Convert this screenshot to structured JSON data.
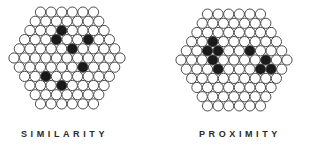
{
  "figure": {
    "panels": [
      {
        "id": "similarity",
        "label": "SIMILARITY",
        "label_pos": {
          "x": 21,
          "y": 129
        },
        "cluster": {
          "center": {
            "x": 67,
            "y": 58
          },
          "radius": 56,
          "spacing": 10.6,
          "circle_radius": 5.1,
          "dark_circles": [
            [
              56,
              35
            ],
            [
              65,
              30
            ],
            [
              88,
              40
            ],
            [
              69,
              52
            ],
            [
              80,
              67
            ],
            [
              43,
              72
            ],
            [
              63,
              82
            ]
          ]
        }
      },
      {
        "id": "proximity",
        "label": "PROXIMITY",
        "label_pos": {
          "x": 199,
          "y": 129
        },
        "cluster": {
          "center": {
            "x": 234,
            "y": 60
          },
          "radius": 57,
          "spacing": 10.6,
          "circle_radius": 5.1,
          "dark_circles": [
            [
              213,
              43
            ],
            [
              207,
              52
            ],
            [
              217,
              53
            ],
            [
              210,
              62
            ],
            [
              220,
              65
            ],
            [
              255,
              52
            ],
            [
              267,
              57
            ],
            [
              267,
              67
            ],
            [
              258,
              72
            ]
          ]
        }
      }
    ],
    "colors": {
      "circle_fill": "#ffffff",
      "circle_stroke": "#3a3a3a",
      "dark_fill": "#1a1a1a",
      "label": "#2a2a2a"
    }
  }
}
